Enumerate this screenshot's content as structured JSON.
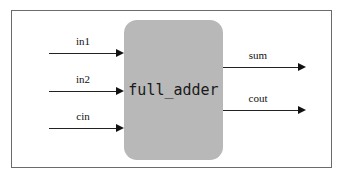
{
  "diagram": {
    "block": {
      "label": "full_adder",
      "fill_color": "#b8b8b8",
      "corner_radius": 13
    },
    "frame": {
      "border_color": "#6b6b6b"
    },
    "inputs": [
      {
        "label": "in1",
        "y": 53
      },
      {
        "label": "in2",
        "y": 91
      },
      {
        "label": "cin",
        "y": 128
      }
    ],
    "outputs": [
      {
        "label": "sum",
        "y": 67
      },
      {
        "label": "cout",
        "y": 110
      }
    ],
    "wire_color": "#222222",
    "text_color": "#111111"
  }
}
